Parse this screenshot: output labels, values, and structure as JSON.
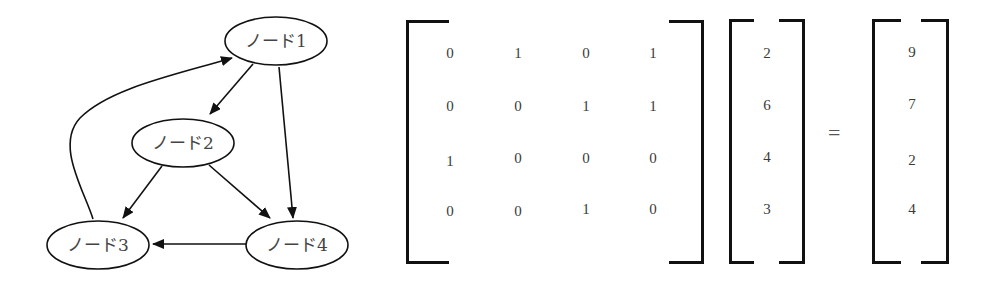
{
  "graph": {
    "nodes": [
      {
        "id": "node1",
        "label": "ノード1",
        "cx": 276,
        "cy": 41
      },
      {
        "id": "node2",
        "label": "ノード2",
        "cx": 183,
        "cy": 143
      },
      {
        "id": "node3",
        "label": "ノード3",
        "cx": 98,
        "cy": 245
      },
      {
        "id": "node4",
        "label": "ノード4",
        "cx": 297,
        "cy": 245
      }
    ],
    "edges": [
      {
        "from": "ノード1",
        "to": "ノード2"
      },
      {
        "from": "ノード1",
        "to": "ノード4"
      },
      {
        "from": "ノード2",
        "to": "ノード3"
      },
      {
        "from": "ノード2",
        "to": "ノード4"
      },
      {
        "from": "ノード3",
        "to": "ノード1"
      },
      {
        "from": "ノード4",
        "to": "ノード3"
      }
    ]
  },
  "equation": {
    "matrix": [
      [
        "0",
        "1",
        "0",
        "1"
      ],
      [
        "0",
        "0",
        "1",
        "1"
      ],
      [
        "1",
        "0",
        "0",
        "0"
      ],
      [
        "0",
        "0",
        "1",
        "0"
      ]
    ],
    "vector": [
      "2",
      "6",
      "4",
      "3"
    ],
    "equals": "=",
    "result": [
      "9",
      "7",
      "2",
      "4"
    ]
  }
}
